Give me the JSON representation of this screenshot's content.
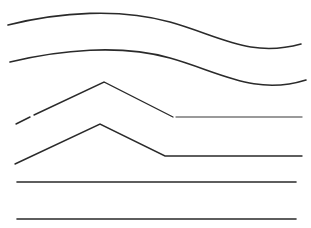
{
  "canvas": {
    "width": 311,
    "height": 228,
    "background": "#ffffff"
  },
  "lines": [
    {
      "id": "curve-1",
      "type": "wave",
      "color": "#2a2a2a",
      "width": 1.6,
      "d": "M8,25 C60,12 120,8 170,22 C220,36 250,58 301,44"
    },
    {
      "id": "curve-2",
      "type": "wave",
      "color": "#2a2a2a",
      "width": 1.6,
      "d": "M10,62 C60,50 120,44 170,58 C220,72 255,96 306,80"
    },
    {
      "id": "angle-1",
      "type": "polyline",
      "color": "#2a2a2a",
      "width": 1.4,
      "points": "16,124 30,117",
      "segment2": "34,115 104,82 173,117",
      "flat": {
        "x1": 176,
        "y1": 117,
        "x2": 302,
        "y2": 117,
        "color": "#7a7a7a"
      }
    },
    {
      "id": "angle-2",
      "type": "polyline",
      "color": "#2a2a2a",
      "width": 1.4,
      "points": "15,164 100,124 165,156 302,156"
    },
    {
      "id": "straight-1",
      "type": "line",
      "color": "#2a2a2a",
      "width": 1.6,
      "x1": 17,
      "y1": 182,
      "x2": 296,
      "y2": 182
    },
    {
      "id": "straight-2",
      "type": "line",
      "color": "#2a2a2a",
      "width": 1.6,
      "x1": 17,
      "y1": 219,
      "x2": 296,
      "y2": 219
    }
  ]
}
